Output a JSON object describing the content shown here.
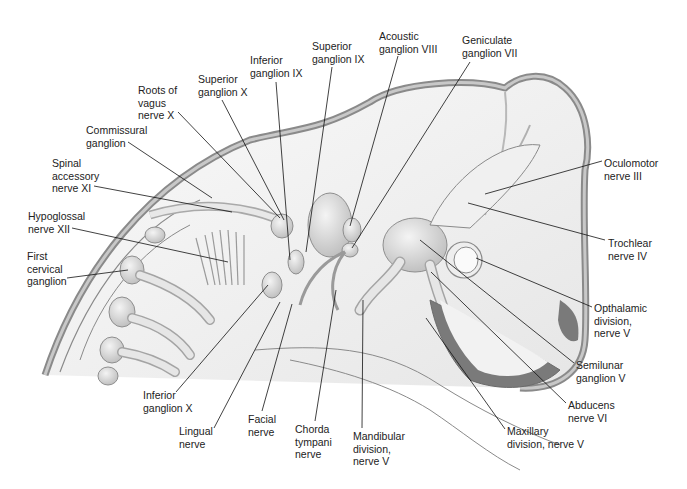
{
  "figure": {
    "colors": {
      "outline": "#8a8a8a",
      "body_fill": "#f2f2f2",
      "shade_dark": "#7a7a7a",
      "nerve_fill": "#e4e4e4",
      "leader": "#111111",
      "text": "#222222"
    }
  },
  "labels": [
    {
      "id": "roots-vagus-x",
      "text": "Roots of\nvagus\nnerve X",
      "x": 138,
      "y": 84
    },
    {
      "id": "superior-ganglion-x",
      "text": "Superior\nganglion X",
      "x": 198,
      "y": 73
    },
    {
      "id": "inferior-ganglion-ix",
      "text": "Inferior\nganglion IX",
      "x": 250,
      "y": 54
    },
    {
      "id": "superior-ganglion-ix",
      "text": "Superior\nganglion IX",
      "x": 312,
      "y": 40
    },
    {
      "id": "acoustic-ganglion-viii",
      "text": "Acoustic\nganglion VIII",
      "x": 379,
      "y": 30
    },
    {
      "id": "geniculate-ganglion-vii",
      "text": "Geniculate\nganglion VII",
      "x": 462,
      "y": 34
    },
    {
      "id": "commissural-ganglion",
      "text": "Commissural\nganglion",
      "x": 86,
      "y": 124
    },
    {
      "id": "spinal-accessory-xi",
      "text": "Spinal\naccessory\nnerve XI",
      "x": 52,
      "y": 157
    },
    {
      "id": "hypoglossal-xii",
      "text": "Hypoglossal\nnerve XII",
      "x": 28,
      "y": 210
    },
    {
      "id": "first-cervical-ganglion",
      "text": "First\ncervical\nganglion",
      "x": 27,
      "y": 250
    },
    {
      "id": "oculomotor-iii",
      "text": "Oculomotor\nnerve III",
      "x": 604,
      "y": 157
    },
    {
      "id": "trochlear-iv",
      "text": "Trochlear\nnerve IV",
      "x": 608,
      "y": 237
    },
    {
      "id": "opthalamic-v",
      "text": "Opthalamic\ndivision,\nnerve V",
      "x": 594,
      "y": 302
    },
    {
      "id": "semilunar-ganglion-v",
      "text": "Semilunar\nganglion V",
      "x": 576,
      "y": 359
    },
    {
      "id": "abducens-vi",
      "text": "Abducens\nnerve VI",
      "x": 568,
      "y": 399
    },
    {
      "id": "maxillary-v",
      "text": "Maxillary\ndivision, nerve V",
      "x": 507,
      "y": 425
    },
    {
      "id": "inferior-ganglion-x",
      "text": "Inferior\nganglion X",
      "x": 143,
      "y": 389
    },
    {
      "id": "lingual-nerve",
      "text": "Lingual\nnerve",
      "x": 179,
      "y": 425
    },
    {
      "id": "facial-nerve",
      "text": "Facial\nnerve",
      "x": 248,
      "y": 413
    },
    {
      "id": "chorda-tympani",
      "text": "Chorda\ntympani\nnerve",
      "x": 295,
      "y": 423
    },
    {
      "id": "mandibular-v",
      "text": "Mandibular\ndivision,\nnerve V",
      "x": 353,
      "y": 430
    }
  ]
}
